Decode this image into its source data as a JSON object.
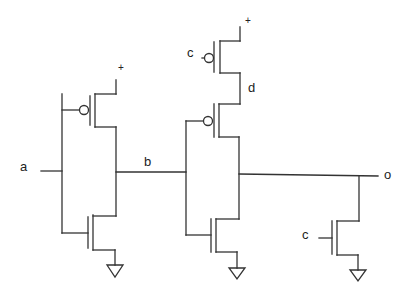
{
  "diagram": {
    "type": "CMOS transistor-level schematic",
    "labels": {
      "input_a": "a",
      "node_b": "b",
      "node_d": "d",
      "output_o": "o",
      "gate_c_top": "c",
      "gate_c_bottom": "c",
      "vdd_1": "+",
      "vdd_2": "+"
    },
    "components": [
      {
        "id": "inverter-1-pmos",
        "type": "PMOS",
        "gate": "a",
        "source": "+",
        "drain": "b"
      },
      {
        "id": "inverter-1-nmos",
        "type": "NMOS",
        "gate": "a",
        "source": "ground",
        "drain": "b"
      },
      {
        "id": "top-pmos-c",
        "type": "PMOS",
        "gate": "c",
        "source": "+",
        "drain": "d"
      },
      {
        "id": "stage-2-pmos",
        "type": "PMOS",
        "gate": "b",
        "source": "d",
        "drain": "o"
      },
      {
        "id": "stage-2-nmos",
        "type": "NMOS",
        "gate": "b",
        "source": "ground",
        "drain": "o"
      },
      {
        "id": "output-nmos-c",
        "type": "NMOS",
        "gate": "c",
        "source": "ground",
        "drain": "o"
      }
    ],
    "colors": {
      "wire": "#333333",
      "background": "#ffffff"
    }
  }
}
